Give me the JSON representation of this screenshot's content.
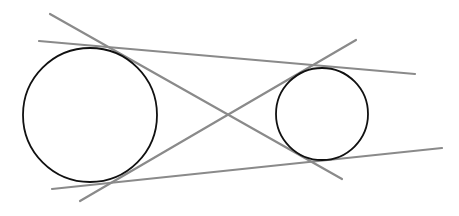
{
  "diagram": {
    "colors": {
      "background": "#ffffff",
      "circle_stroke": "#111111",
      "line_stroke": "#8a8a8a"
    },
    "circles": [
      {
        "id": "large-circle",
        "cx": 90,
        "cy": 115,
        "r": 67
      },
      {
        "id": "small-circle",
        "cx": 322,
        "cy": 114,
        "r": 46
      }
    ],
    "lines": [
      {
        "id": "external-tangent-top",
        "x1": 39,
        "y1": 41,
        "x2": 415,
        "y2": 74
      },
      {
        "id": "external-tangent-bottom",
        "x1": 52,
        "y1": 189,
        "x2": 442,
        "y2": 148
      },
      {
        "id": "internal-tangent-1",
        "x1": 50,
        "y1": 14,
        "x2": 342,
        "y2": 179
      },
      {
        "id": "internal-tangent-2",
        "x1": 80,
        "y1": 201,
        "x2": 356,
        "y2": 40
      }
    ]
  }
}
